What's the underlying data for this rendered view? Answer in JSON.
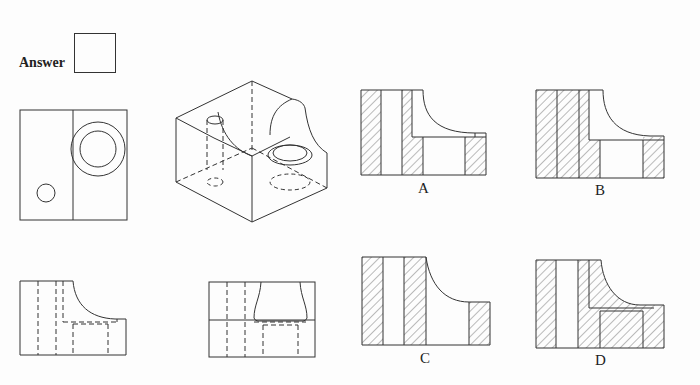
{
  "question": {
    "answer_label": "Answer",
    "answer_value": ""
  },
  "options": [
    {
      "id": "A",
      "label": "A"
    },
    {
      "id": "B",
      "label": "B"
    },
    {
      "id": "C",
      "label": "C"
    },
    {
      "id": "D",
      "label": "D"
    }
  ],
  "views": {
    "top_view": "top-view",
    "isometric_view": "isometric-view",
    "front_view": "front-view",
    "side_view": "side-view"
  },
  "colors": {
    "line": "#333333",
    "background": "#fdfdfd"
  }
}
